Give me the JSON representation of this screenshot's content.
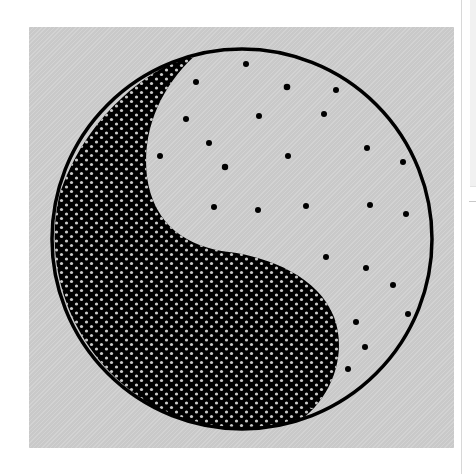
{
  "image": {
    "subject": "yin-yang symbol",
    "style": "stippled black-and-white illustration",
    "background_color": "#c9c9c9",
    "ink_color": "#000000",
    "dot_color_on_dark": "#c9c9c9"
  },
  "side_panel": {
    "visible": true
  }
}
